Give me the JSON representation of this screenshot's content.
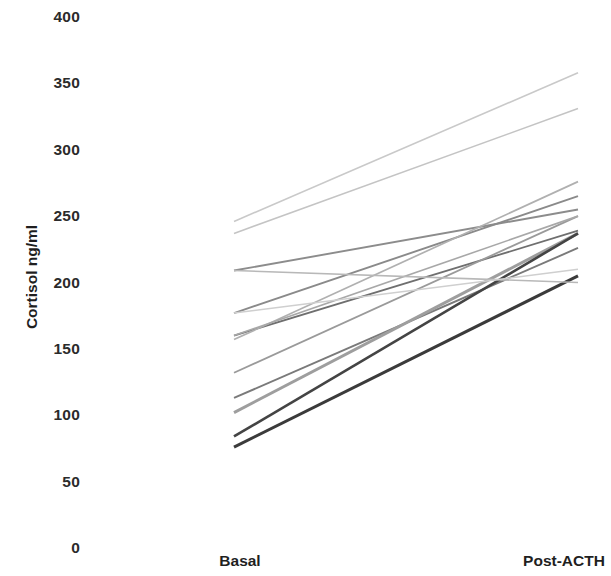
{
  "chart_data": {
    "type": "line",
    "title": "",
    "subtitle": "",
    "xlabel": "",
    "ylabel": "Cortisol ng/ml",
    "categories": [
      "Basal",
      "Post-ACTH"
    ],
    "x": [
      0,
      1
    ],
    "ylim": [
      0,
      400
    ],
    "yticks": [
      0,
      50,
      100,
      150,
      200,
      250,
      300,
      350,
      400
    ],
    "ytick_labels": [
      "0",
      "50",
      "100",
      "150",
      "200",
      "250",
      "300",
      "350",
      "400"
    ],
    "grid": false,
    "legend": false,
    "legend_position": "none",
    "axis_lines_visible": false,
    "series": [
      {
        "name": "Subject 1",
        "values": [
          246,
          358
        ],
        "color": "#c9c9c9",
        "width": 1.6
      },
      {
        "name": "Subject 2",
        "values": [
          237,
          331
        ],
        "color": "#c4c4c4",
        "width": 1.6
      },
      {
        "name": "Subject 3",
        "values": [
          209,
          255
        ],
        "color": "#8c8c8c",
        "width": 1.9
      },
      {
        "name": "Subject 4",
        "values": [
          177,
          265
        ],
        "color": "#8a8a8a",
        "width": 1.9
      },
      {
        "name": "Subject 5",
        "values": [
          160,
          239
        ],
        "color": "#6f6f6f",
        "width": 1.8
      },
      {
        "name": "Subject 6",
        "values": [
          157,
          276
        ],
        "color": "#b0b0b0",
        "width": 1.7
      },
      {
        "name": "Subject 7",
        "values": [
          132,
          250
        ],
        "color": "#9a9a9a",
        "width": 1.8
      },
      {
        "name": "Subject 8",
        "values": [
          113,
          226
        ],
        "color": "#7a7a7a",
        "width": 1.9
      },
      {
        "name": "Subject 9",
        "values": [
          102,
          237
        ],
        "color": "#9e9e9e",
        "width": 3.0
      },
      {
        "name": "Subject 10",
        "values": [
          84,
          237
        ],
        "color": "#444444",
        "width": 2.6
      },
      {
        "name": "Subject 11",
        "values": [
          76,
          205
        ],
        "color": "#3b3b3b",
        "width": 3.0
      },
      {
        "name": "Subject 12",
        "values": [
          160,
          250
        ],
        "color": "#a8a8a8",
        "width": 1.6
      },
      {
        "name": "Subject 13",
        "values": [
          209,
          200
        ],
        "color": "#b8b8b8",
        "width": 1.6
      },
      {
        "name": "Subject 14",
        "values": [
          177,
          210
        ],
        "color": "#cfcfcf",
        "width": 1.5
      }
    ]
  },
  "axis": {
    "y_title": "Cortisol ng/ml",
    "ticks": [
      {
        "label": "400",
        "value": 400
      },
      {
        "label": "350",
        "value": 350
      },
      {
        "label": "300",
        "value": 300
      },
      {
        "label": "250",
        "value": 250
      },
      {
        "label": "200",
        "value": 200
      },
      {
        "label": "150",
        "value": 150
      },
      {
        "label": "100",
        "value": 100
      },
      {
        "label": "50",
        "value": 50
      },
      {
        "label": "0",
        "value": 0
      }
    ],
    "x_categories": [
      {
        "label": "Basal"
      },
      {
        "label": "Post-ACTH"
      }
    ]
  },
  "colors": {
    "background": "#ffffff",
    "text": "#1f1f1f",
    "tick_text": "#2b2b2b"
  }
}
